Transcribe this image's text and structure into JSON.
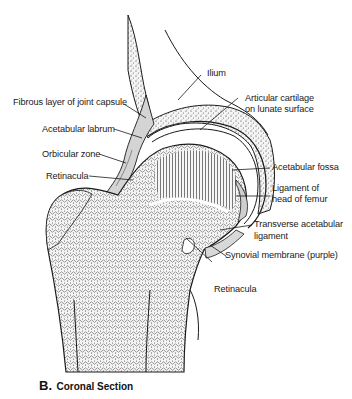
{
  "figure": {
    "caption_letter": "B.",
    "caption_text": "Coronal Section",
    "colors": {
      "ink": "#1a1a1a",
      "bone_fill": "#f2f2f2",
      "cartilage": "#ffffff",
      "capsule": "#cfcfcf",
      "background": "#ffffff"
    }
  },
  "labels": {
    "ilium": "Ilium",
    "articular_cartilage_1": "Articular cartilage",
    "articular_cartilage_2": "on lunate surface",
    "fibrous_layer": "Fibrous layer of joint capsule",
    "acetabular_labrum": "Acetabular labrum",
    "orbicular_zone": "Orbicular zone",
    "retinacula_left": "Retinacula",
    "acetabular_fossa": "Acetabular fossa",
    "ligament_head_1": "Ligament of",
    "ligament_head_2": "head of femur",
    "transverse_1": "Transverse acetabular",
    "transverse_2": "ligament",
    "synovial_membrane": "Synovial membrane (purple)",
    "retinacula_bottom": "Retinacula"
  }
}
